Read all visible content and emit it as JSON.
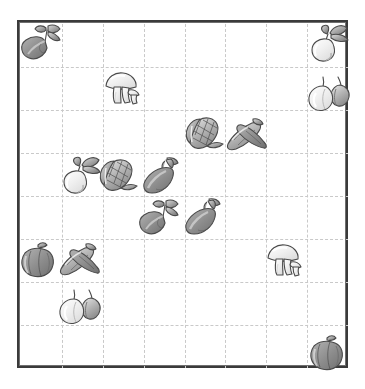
{
  "board": {
    "title": "Vegetable Grid Puzzle",
    "frame_color": "#3a3a3a",
    "grid_line_color": "#c9c9c9",
    "background_color": "#ffffff",
    "columns": 8,
    "rows": 8,
    "cell_width": 41,
    "cell_height": 43,
    "frame_left": 17,
    "frame_top": 20,
    "frame_width": 331,
    "frame_height": 348
  },
  "palette": {
    "outline": "#4a4a4a",
    "dark_fill": "#8c8c8c",
    "mid_fill": "#b3b3b3",
    "light_fill": "#dcdcdc",
    "pale_fill": "#f0f0f0",
    "leaf_fill": "#9a9a9a",
    "shadow": "#707070"
  },
  "icons": [
    {
      "id": "icon-1",
      "name": "eggplant-with-leaves",
      "label": "Eggplant with leaves",
      "col": 0,
      "row": 0,
      "x": 18,
      "y": 22,
      "width": 48,
      "height": 42
    },
    {
      "id": "icon-2",
      "name": "turnip-with-greens",
      "label": "Turnip with greens",
      "col": 7,
      "row": 0,
      "x": 306,
      "y": 23,
      "width": 44,
      "height": 42
    },
    {
      "id": "icon-3",
      "name": "mushrooms",
      "label": "Mushrooms",
      "col": 2,
      "row": 1,
      "x": 100,
      "y": 68,
      "width": 44,
      "height": 42
    },
    {
      "id": "icon-4",
      "name": "onions",
      "label": "Onions",
      "col": 7,
      "row": 1,
      "x": 307,
      "y": 72,
      "width": 44,
      "height": 40
    },
    {
      "id": "icon-5",
      "name": "corn",
      "label": "Corn on the cob",
      "col": 4,
      "row": 2,
      "x": 184,
      "y": 113,
      "width": 44,
      "height": 42
    },
    {
      "id": "icon-6",
      "name": "peanuts",
      "label": "Peanuts",
      "col": 5,
      "row": 2,
      "x": 224,
      "y": 114,
      "width": 44,
      "height": 42
    },
    {
      "id": "icon-7",
      "name": "turnip-with-greens",
      "label": "Turnip with greens",
      "col": 1,
      "row": 3,
      "x": 58,
      "y": 155,
      "width": 44,
      "height": 42
    },
    {
      "id": "icon-8",
      "name": "corn",
      "label": "Corn on the cob",
      "col": 2,
      "row": 3,
      "x": 98,
      "y": 155,
      "width": 44,
      "height": 42
    },
    {
      "id": "icon-9",
      "name": "eggplant",
      "label": "Eggplant",
      "col": 3,
      "row": 3,
      "x": 138,
      "y": 155,
      "width": 44,
      "height": 42
    },
    {
      "id": "icon-10",
      "name": "eggplant-with-leaves",
      "label": "Eggplant with leaves",
      "col": 3,
      "row": 4,
      "x": 136,
      "y": 197,
      "width": 48,
      "height": 42
    },
    {
      "id": "icon-11",
      "name": "eggplant",
      "label": "Eggplant",
      "col": 4,
      "row": 4,
      "x": 180,
      "y": 196,
      "width": 44,
      "height": 42
    },
    {
      "id": "icon-12",
      "name": "bell-pepper",
      "label": "Bell pepper",
      "col": 0,
      "row": 5,
      "x": 17,
      "y": 239,
      "width": 44,
      "height": 42
    },
    {
      "id": "icon-13",
      "name": "peanuts",
      "label": "Peanuts",
      "col": 1,
      "row": 5,
      "x": 57,
      "y": 239,
      "width": 44,
      "height": 42
    },
    {
      "id": "icon-14",
      "name": "mushrooms",
      "label": "Mushrooms",
      "col": 6,
      "row": 5,
      "x": 262,
      "y": 240,
      "width": 44,
      "height": 42
    },
    {
      "id": "icon-15",
      "name": "onions",
      "label": "Onions",
      "col": 1,
      "row": 6,
      "x": 58,
      "y": 285,
      "width": 44,
      "height": 40
    },
    {
      "id": "icon-16",
      "name": "bell-pepper",
      "label": "Bell pepper",
      "col": 7,
      "row": 7,
      "x": 306,
      "y": 332,
      "width": 44,
      "height": 42
    }
  ]
}
